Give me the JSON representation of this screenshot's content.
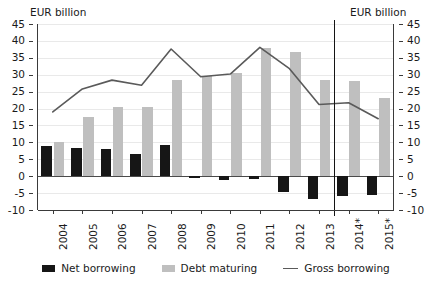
{
  "axis_caption_left": "EUR billion",
  "axis_caption_right": "EUR billion",
  "legend": {
    "net": "Net borrowing",
    "debt": "Debt maturing",
    "gross": "Gross borrowing"
  },
  "colors": {
    "net_borrowing": "#161616",
    "debt_maturing": "#bfbfbf",
    "gross_borrowing": "#5a5a5a",
    "grid": "#e9e9e9",
    "axis": "#3a3a3a",
    "forecast_divider": "#141414"
  },
  "chart_data": {
    "type": "bar",
    "title": "",
    "subtitle": "",
    "xlabel": "",
    "ylabel": "EUR billion",
    "ylim": [
      -10,
      45
    ],
    "ytick_values": [
      -10,
      -5,
      0,
      5,
      10,
      15,
      20,
      25,
      30,
      35,
      40,
      45
    ],
    "ytick_labels": [
      "-10",
      "-5",
      "0",
      "5",
      "10",
      "15",
      "20",
      "25",
      "30",
      "35",
      "40",
      "45"
    ],
    "grid": true,
    "grid_axis": "y",
    "dual_axis": true,
    "legend_position": "bottom",
    "categories": [
      "2004",
      "2005",
      "2006",
      "2007",
      "2008",
      "2009",
      "2010",
      "2011",
      "2012",
      "2013",
      "2014*",
      "2015*"
    ],
    "series": [
      {
        "name": "Net borrowing",
        "type": "bar",
        "color": "#161616",
        "values": [
          8.8,
          8.2,
          8.0,
          6.6,
          9.1,
          -0.4,
          -1.2,
          -0.8,
          -4.8,
          -6.8,
          -5.8,
          -5.6
        ]
      },
      {
        "name": "Debt maturing",
        "type": "bar",
        "color": "#bfbfbf",
        "values": [
          10.2,
          17.6,
          20.6,
          20.4,
          28.3,
          29.5,
          30.5,
          38.0,
          36.6,
          28.3,
          28.0,
          23.0
        ]
      },
      {
        "name": "Gross borrowing",
        "type": "line",
        "color": "#5a5a5a",
        "values": [
          19.0,
          25.8,
          28.4,
          26.9,
          37.6,
          29.4,
          30.2,
          38.1,
          31.8,
          21.2,
          21.7,
          17.0
        ]
      }
    ],
    "annotations": [
      {
        "type": "vline",
        "name": "forecast-divider",
        "between": [
          "2013",
          "2014*"
        ],
        "note": "separates actuals from forecast years marked with *"
      }
    ]
  }
}
